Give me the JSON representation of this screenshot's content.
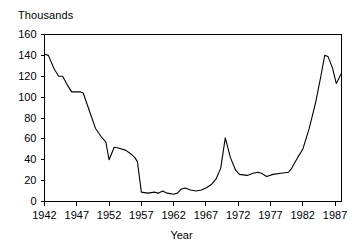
{
  "chart_data": {
    "type": "line",
    "title": "",
    "unit_label": "Thousands",
    "xlabel": "Year",
    "ylabel": "",
    "xlim": [
      1942,
      1988
    ],
    "ylim": [
      0,
      160
    ],
    "grid": false,
    "legend": false,
    "yticks": [
      0,
      20,
      40,
      60,
      80,
      100,
      120,
      140,
      160
    ],
    "ytick_labels": [
      "0",
      "20",
      "40",
      "60",
      "80",
      "100",
      "120",
      "140",
      "160"
    ],
    "xticks": [
      1942,
      1947,
      1952,
      1957,
      1962,
      1967,
      1972,
      1977,
      1982,
      1987
    ],
    "xtick_labels": [
      "1942",
      "1947",
      "1952",
      "1957",
      "1962",
      "1967",
      "1972",
      "1977",
      "1982",
      "1987"
    ],
    "line_color": "#000000",
    "x": [
      1942,
      1943,
      1944,
      1945,
      1946,
      1947,
      1948,
      1949,
      1950,
      1951,
      1952,
      1953,
      1954,
      1955,
      1956,
      1957,
      1958,
      1959,
      1960,
      1961,
      1962,
      1963,
      1964,
      1965,
      1966,
      1967,
      1968,
      1969,
      1970,
      1971,
      1972,
      1973,
      1974,
      1975,
      1976,
      1977,
      1978,
      1979,
      1980,
      1981,
      1982,
      1983,
      1984,
      1985,
      1986,
      1987,
      1988
    ],
    "values": [
      141,
      140,
      127,
      120,
      111,
      105,
      105,
      105,
      70,
      60,
      55,
      40,
      52,
      51,
      49,
      44,
      42,
      9,
      8,
      9,
      10,
      8,
      7,
      8,
      13,
      12,
      11,
      10,
      11,
      13,
      16,
      22,
      32,
      61,
      42,
      30,
      26,
      26,
      27,
      28,
      27,
      25,
      24,
      26,
      27,
      28,
      28
    ],
    "series": [
      {
        "name": "value",
        "values": [
          141,
          140,
          127,
          120,
          111,
          105,
          105,
          105,
          70,
          60,
          55,
          40,
          52,
          51,
          49,
          44,
          42,
          9,
          8,
          9,
          10,
          8,
          7,
          8,
          13,
          12,
          11,
          10,
          11,
          13,
          16,
          22,
          32,
          61,
          42,
          30,
          26,
          26,
          27,
          28,
          27,
          25,
          24,
          26,
          27,
          28,
          28
        ]
      }
    ],
    "points": [
      {
        "x": 1942.0,
        "y": 141
      },
      {
        "x": 1942.6,
        "y": 140
      },
      {
        "x": 1943.5,
        "y": 127
      },
      {
        "x": 1944.2,
        "y": 120
      },
      {
        "x": 1944.8,
        "y": 120
      },
      {
        "x": 1945.6,
        "y": 111
      },
      {
        "x": 1946.2,
        "y": 105
      },
      {
        "x": 1947.6,
        "y": 105
      },
      {
        "x": 1948.0,
        "y": 104
      },
      {
        "x": 1949.0,
        "y": 86
      },
      {
        "x": 1949.9,
        "y": 70
      },
      {
        "x": 1950.8,
        "y": 62
      },
      {
        "x": 1951.5,
        "y": 57
      },
      {
        "x": 1952.0,
        "y": 40
      },
      {
        "x": 1952.8,
        "y": 52
      },
      {
        "x": 1953.6,
        "y": 51
      },
      {
        "x": 1954.6,
        "y": 49
      },
      {
        "x": 1955.5,
        "y": 45
      },
      {
        "x": 1956.0,
        "y": 42
      },
      {
        "x": 1956.4,
        "y": 38
      },
      {
        "x": 1957.0,
        "y": 9
      },
      {
        "x": 1958.0,
        "y": 8
      },
      {
        "x": 1959.0,
        "y": 9
      },
      {
        "x": 1959.6,
        "y": 8
      },
      {
        "x": 1960.3,
        "y": 10
      },
      {
        "x": 1961.0,
        "y": 8
      },
      {
        "x": 1962.0,
        "y": 7
      },
      {
        "x": 1962.6,
        "y": 8
      },
      {
        "x": 1963.2,
        "y": 12
      },
      {
        "x": 1963.8,
        "y": 13
      },
      {
        "x": 1964.6,
        "y": 11
      },
      {
        "x": 1965.5,
        "y": 10
      },
      {
        "x": 1966.3,
        "y": 11
      },
      {
        "x": 1967.0,
        "y": 13
      },
      {
        "x": 1967.8,
        "y": 16
      },
      {
        "x": 1968.6,
        "y": 22
      },
      {
        "x": 1969.3,
        "y": 32
      },
      {
        "x": 1970.0,
        "y": 61
      },
      {
        "x": 1970.8,
        "y": 42
      },
      {
        "x": 1971.6,
        "y": 30
      },
      {
        "x": 1972.2,
        "y": 26
      },
      {
        "x": 1973.4,
        "y": 25
      },
      {
        "x": 1974.3,
        "y": 27
      },
      {
        "x": 1975.0,
        "y": 28
      },
      {
        "x": 1975.6,
        "y": 27
      },
      {
        "x": 1976.4,
        "y": 24
      },
      {
        "x": 1977.4,
        "y": 26
      },
      {
        "x": 1978.6,
        "y": 27
      },
      {
        "x": 1979.8,
        "y": 28
      },
      {
        "x": 1980.3,
        "y": 32
      },
      {
        "x": 1981.2,
        "y": 42
      },
      {
        "x": 1982.0,
        "y": 50
      },
      {
        "x": 1983.0,
        "y": 70
      },
      {
        "x": 1984.0,
        "y": 95
      },
      {
        "x": 1984.8,
        "y": 120
      },
      {
        "x": 1985.4,
        "y": 140
      },
      {
        "x": 1985.9,
        "y": 139
      },
      {
        "x": 1986.6,
        "y": 128
      },
      {
        "x": 1987.2,
        "y": 113
      },
      {
        "x": 1988.0,
        "y": 123
      }
    ]
  }
}
